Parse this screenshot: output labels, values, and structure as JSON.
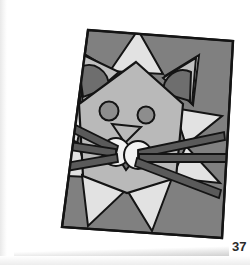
{
  "page": {
    "background_color": "#ffffff",
    "page_number": "37",
    "figure_alt": "geometric cat face illustration"
  },
  "canvas": {
    "name": "gray-square-canvas",
    "fill": "#808080",
    "stroke": "#151515",
    "rotation_deg": -1.8,
    "corners": "88,30 232,40 222,237 62,228"
  },
  "palette": {
    "background_gray": "#808080",
    "face_gray": "#b9b9b9",
    "spike_light": "#e2e2e2",
    "ear_inner_dark": "#6e6e6e",
    "eye_gray": "#8d8d8d",
    "cheek_white": "#f2f2f2",
    "chin_dark": "#6f6f6f",
    "whisker_fill": "#5a5a5a",
    "outline": "#141414"
  },
  "figure": {
    "parts": [
      {
        "name": "star-spike-top",
        "label": "top spike"
      },
      {
        "name": "star-spike-upper-left",
        "label": "upper left spike"
      },
      {
        "name": "star-spike-upper-right",
        "label": "upper right spike"
      },
      {
        "name": "star-spike-left",
        "label": "left spike"
      },
      {
        "name": "star-spike-right",
        "label": "right spike"
      },
      {
        "name": "star-spike-lower-left",
        "label": "lower left spike"
      },
      {
        "name": "star-spike-lower-right",
        "label": "lower right spike"
      },
      {
        "name": "star-spike-bottom-left",
        "label": "bottom left spike"
      },
      {
        "name": "star-spike-bottom-right",
        "label": "bottom right spike"
      },
      {
        "name": "cat-head",
        "label": "head"
      },
      {
        "name": "ear-left",
        "label": "left ear"
      },
      {
        "name": "ear-right",
        "label": "right ear"
      },
      {
        "name": "ear-inner-left",
        "label": "left inner ear"
      },
      {
        "name": "ear-inner-right",
        "label": "right inner ear"
      },
      {
        "name": "eye-left",
        "label": "left eye"
      },
      {
        "name": "eye-right",
        "label": "right eye"
      },
      {
        "name": "nose",
        "label": "nose"
      },
      {
        "name": "cheek-left",
        "label": "left cheek"
      },
      {
        "name": "cheek-right",
        "label": "right cheek"
      },
      {
        "name": "chin",
        "label": "chin"
      },
      {
        "name": "whisker-left-upper",
        "label": "left upper whisker"
      },
      {
        "name": "whisker-left-middle",
        "label": "left middle whisker"
      },
      {
        "name": "whisker-left-lower",
        "label": "left lower whisker"
      },
      {
        "name": "whisker-right-upper",
        "label": "right upper whisker"
      },
      {
        "name": "whisker-right-middle",
        "label": "right middle whisker"
      },
      {
        "name": "whisker-right-lower",
        "label": "right lower whisker"
      }
    ]
  }
}
